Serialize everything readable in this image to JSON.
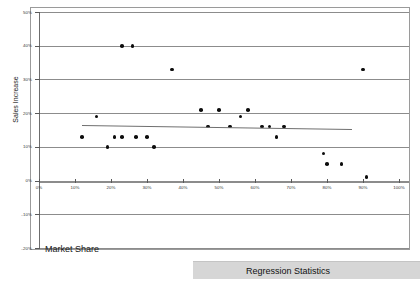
{
  "chart_data": {
    "type": "scatter",
    "title": "",
    "xlabel": "Market Share",
    "ylabel": "Sales Increase",
    "xlim": [
      0,
      100
    ],
    "ylim": [
      -20,
      50
    ],
    "xtick_labels": [
      "0%",
      "10%",
      "20%",
      "30%",
      "40%",
      "50%",
      "60%",
      "70%",
      "80%",
      "90%",
      "100%"
    ],
    "xticks": [
      0,
      10,
      20,
      30,
      40,
      50,
      60,
      70,
      80,
      90,
      100
    ],
    "ytick_labels": [
      "50%",
      "40%",
      "30%",
      "20%",
      "10%",
      "0%",
      "-10%",
      "-20%"
    ],
    "yticks": [
      50,
      40,
      30,
      20,
      10,
      0,
      -10,
      -20
    ],
    "grid": true,
    "grid_axis": "y",
    "legend": false,
    "series": [
      {
        "name": "Market Share vs Sales Increase",
        "marker": "circle",
        "color": "#0d0d0d",
        "points": [
          {
            "x": 12,
            "y": 13
          },
          {
            "x": 16,
            "y": 19
          },
          {
            "x": 19,
            "y": 10
          },
          {
            "x": 21,
            "y": 13
          },
          {
            "x": 23,
            "y": 40
          },
          {
            "x": 23,
            "y": 13
          },
          {
            "x": 26,
            "y": 40
          },
          {
            "x": 27,
            "y": 13
          },
          {
            "x": 30,
            "y": 13
          },
          {
            "x": 32,
            "y": 10
          },
          {
            "x": 37,
            "y": 33
          },
          {
            "x": 45,
            "y": 21
          },
          {
            "x": 47,
            "y": 16
          },
          {
            "x": 50,
            "y": 21
          },
          {
            "x": 53,
            "y": 16
          },
          {
            "x": 56,
            "y": 19
          },
          {
            "x": 58,
            "y": 21
          },
          {
            "x": 62,
            "y": 16
          },
          {
            "x": 64,
            "y": 16
          },
          {
            "x": 66,
            "y": 13
          },
          {
            "x": 68,
            "y": 16
          },
          {
            "x": 79,
            "y": 8
          },
          {
            "x": 80,
            "y": 5
          },
          {
            "x": 84,
            "y": 5
          },
          {
            "x": 90,
            "y": 33
          },
          {
            "x": 91,
            "y": 1
          }
        ]
      }
    ],
    "trendline": {
      "type": "linear",
      "x_start": 12,
      "y_start": 16.4,
      "x_end": 87,
      "y_end": 15.2,
      "color": "#6f6f6f"
    }
  },
  "footer": {
    "regression_statistics_label": "Regression Statistics"
  }
}
